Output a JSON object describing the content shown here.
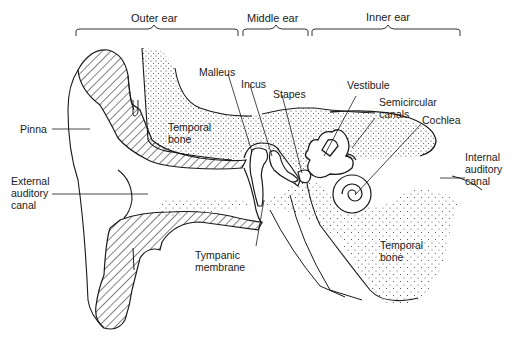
{
  "diagram": {
    "type": "anatomical-cross-section",
    "colors": {
      "ink": "#1a1a1a",
      "background": "#ffffff",
      "stipple": "#3a3a3a"
    },
    "sections": [
      {
        "id": "outer",
        "label": "Outer ear"
      },
      {
        "id": "middle",
        "label": "Middle ear"
      },
      {
        "id": "inner",
        "label": "Inner ear"
      }
    ],
    "labels": {
      "pinna": "Pinna",
      "external_auditory_canal": "External\nauditory\ncanal",
      "temporal_bone_upper": "Temporal\nbone",
      "malleus": "Malleus",
      "incus": "Incus",
      "stapes": "Stapes",
      "vestibule": "Vestibule",
      "semicircular_canals": "Semicircular\ncanals",
      "cochlea": "Cochlea",
      "internal_auditory_canal": "Internal\nauditory\ncanal",
      "tympanic_membrane": "Tympanic\nmembrane",
      "temporal_bone_lower": "Temporal\nbone"
    }
  }
}
